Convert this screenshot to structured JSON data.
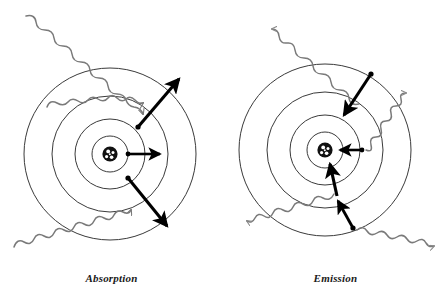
{
  "figure": {
    "background_color": "#ffffff",
    "width": 447,
    "height": 303,
    "ring_stroke_color": "#3a3a3a",
    "photon_wave_color": "#7a7a7a",
    "arrow_color": "#000000",
    "nucleus_color": "#111111",
    "electron_dot_color": "#000000",
    "caption_color": "#1a1a1a"
  },
  "panels": [
    {
      "id": "absorption",
      "caption": "Absorption",
      "center": {
        "x": 110,
        "y": 154
      },
      "orbit_radii": [
        18,
        35,
        58,
        86
      ],
      "nucleus_radius": 8,
      "nucleus_label": "nucleus",
      "photon_direction": "inbound",
      "electron_direction": "outward",
      "electrons": [
        {
          "name": "electron-upper",
          "x": 138,
          "y": 127,
          "orbit": 2
        },
        {
          "name": "electron-lower",
          "x": 128,
          "y": 178,
          "orbit": 1
        },
        {
          "name": "electron-core",
          "x": 128,
          "y": 154,
          "orbit": 1
        }
      ],
      "transition_arrows": [
        {
          "name": "transition-arrow-upper",
          "from_x": 138,
          "from_y": 127,
          "to_x": 179,
          "to_y": 79,
          "direction": "outward"
        },
        {
          "name": "transition-arrow-lower",
          "from_x": 128,
          "from_y": 178,
          "to_x": 167,
          "to_y": 226,
          "direction": "outward"
        },
        {
          "name": "transition-arrow-core",
          "from_x": 128,
          "from_y": 154,
          "to_x": 160,
          "to_y": 154,
          "direction": "outward"
        }
      ],
      "photons": [
        {
          "name": "photon-upper",
          "start_x": 26,
          "start_y": 16,
          "end_x": 140,
          "end_y": 103,
          "direction": "inbound"
        },
        {
          "name": "photon-middle",
          "start_x": 47,
          "start_y": 107,
          "end_x": 128,
          "end_y": 147,
          "direction": "inbound"
        },
        {
          "name": "photon-lower",
          "start_x": 14,
          "start_y": 247,
          "end_x": 131,
          "end_y": 193,
          "direction": "inbound"
        }
      ]
    },
    {
      "id": "emission",
      "caption": "Emission",
      "center": {
        "x": 325,
        "y": 150
      },
      "orbit_radii": [
        18,
        35,
        58,
        86
      ],
      "nucleus_radius": 8,
      "nucleus_label": "nucleus",
      "photon_direction": "outbound",
      "electron_direction": "inward",
      "electrons": [
        {
          "name": "electron-upper",
          "x": 371,
          "y": 74,
          "orbit": 3
        },
        {
          "name": "electron-lower",
          "x": 353,
          "y": 228,
          "orbit": 3
        },
        {
          "name": "electron-core",
          "x": 362,
          "y": 150,
          "orbit": 1
        }
      ],
      "transition_arrows": [
        {
          "name": "transition-arrow-upper",
          "from_x": 371,
          "from_y": 74,
          "to_x": 344,
          "to_y": 115,
          "direction": "inward"
        },
        {
          "name": "transition-arrow-lower-outer",
          "from_x": 353,
          "from_y": 228,
          "to_x": 338,
          "to_y": 202,
          "direction": "inward"
        },
        {
          "name": "transition-arrow-lower-inner",
          "from_x": 336,
          "from_y": 195,
          "to_x": 331,
          "to_y": 165,
          "direction": "inward"
        },
        {
          "name": "transition-arrow-core",
          "from_x": 362,
          "from_y": 150,
          "to_x": 340,
          "to_y": 150,
          "direction": "inward"
        }
      ],
      "photons": [
        {
          "name": "photon-upper",
          "start_x": 355,
          "start_y": 99,
          "end_x": 276,
          "end_y": 21,
          "direction": "outbound"
        },
        {
          "name": "photon-middle",
          "start_x": 364,
          "start_y": 149,
          "end_x": 420,
          "end_y": 101,
          "direction": "outbound"
        },
        {
          "name": "photon-lower-left",
          "start_x": 333,
          "start_y": 195,
          "end_x": 248,
          "end_y": 228,
          "direction": "outbound"
        },
        {
          "name": "photon-lower-right",
          "start_x": 355,
          "start_y": 228,
          "end_x": 429,
          "end_y": 260,
          "direction": "outbound"
        }
      ]
    }
  ]
}
